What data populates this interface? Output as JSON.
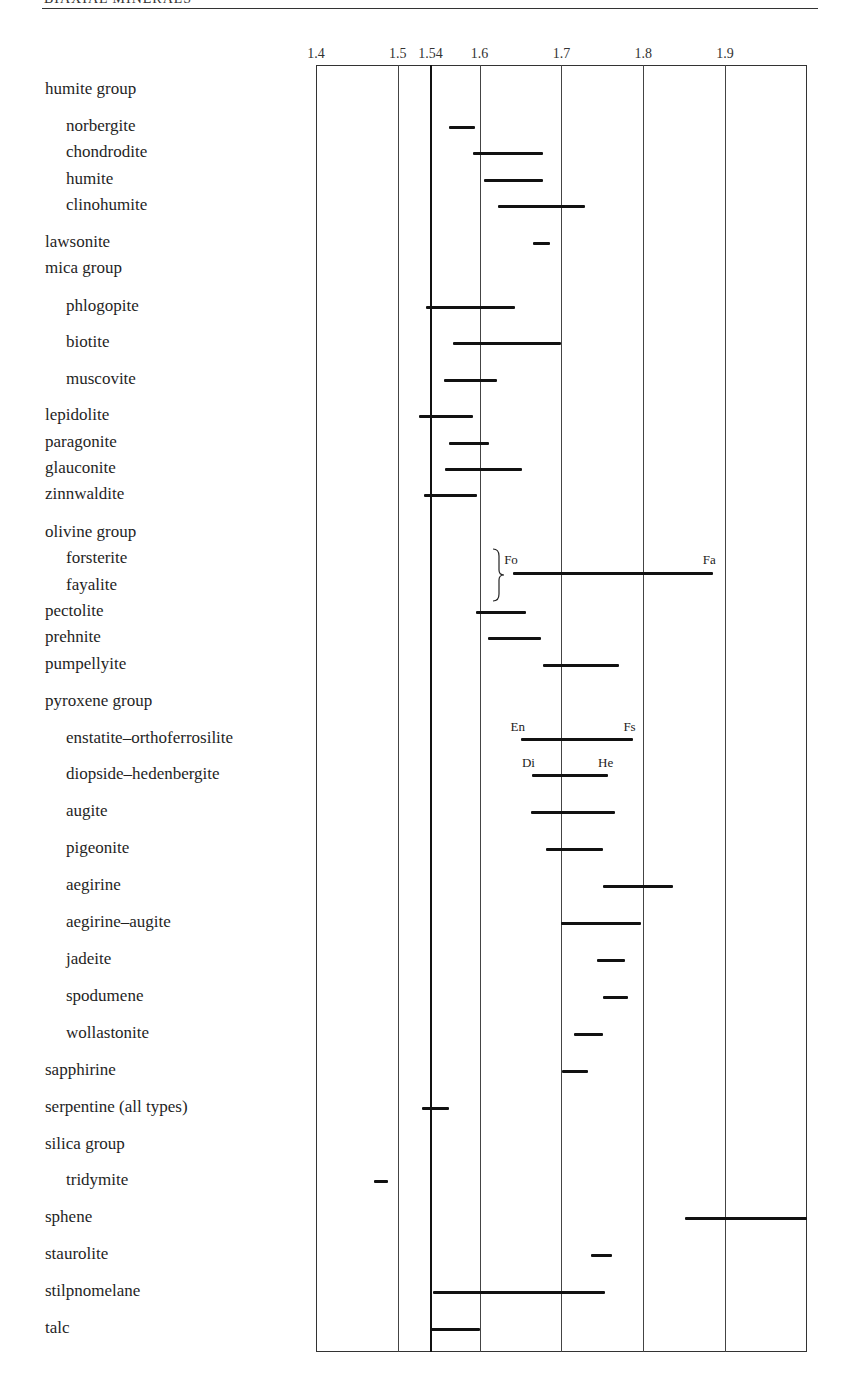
{
  "header": {
    "title": "BIAXIAL MINERALS"
  },
  "chart_data": {
    "type": "range-bar",
    "title": "",
    "xlabel": "",
    "ylabel": "",
    "xlim": [
      1.4,
      2.0
    ],
    "x_ticks": [
      "1.4",
      "1.5",
      "1.54",
      "1.6",
      "1.7",
      "1.8",
      "1.9"
    ],
    "x_tick_values": [
      1.4,
      1.5,
      1.54,
      1.6,
      1.7,
      1.8,
      1.9
    ],
    "reference_line": 1.54,
    "grid": true,
    "legend": null,
    "rows": [
      {
        "label": "humite group",
        "kind": "group",
        "y": 90
      },
      {
        "label": "norbergite",
        "kind": "sub",
        "y": 127,
        "range": [
          1.563,
          1.594
        ]
      },
      {
        "label": "chondrodite",
        "kind": "sub",
        "y": 153,
        "range": [
          1.592,
          1.678
        ]
      },
      {
        "label": "humite",
        "kind": "sub",
        "y": 180,
        "range": [
          1.605,
          1.678
        ]
      },
      {
        "label": "clinohumite",
        "kind": "sub",
        "y": 206,
        "range": [
          1.623,
          1.729
        ]
      },
      {
        "label": "lawsonite",
        "kind": "group",
        "y": 243,
        "range": [
          1.665,
          1.686
        ]
      },
      {
        "label": "mica group",
        "kind": "group",
        "y": 269
      },
      {
        "label": "phlogopite",
        "kind": "sub",
        "y": 307,
        "range": [
          1.534,
          1.643
        ]
      },
      {
        "label": "biotite",
        "kind": "sub",
        "y": 343,
        "range": [
          1.568,
          1.699
        ]
      },
      {
        "label": "muscovite",
        "kind": "sub",
        "y": 380,
        "range": [
          1.556,
          1.621
        ]
      },
      {
        "label": "lepidolite",
        "kind": "group",
        "y": 416,
        "range": [
          1.526,
          1.592
        ]
      },
      {
        "label": "paragonite",
        "kind": "group",
        "y": 443,
        "range": [
          1.562,
          1.612
        ]
      },
      {
        "label": "glauconite",
        "kind": "group",
        "y": 469,
        "range": [
          1.558,
          1.652
        ]
      },
      {
        "label": "zinnwaldite",
        "kind": "group",
        "y": 495,
        "range": [
          1.532,
          1.597
        ]
      },
      {
        "label": "olivine group",
        "kind": "group",
        "y": 533
      },
      {
        "label": "forsterite",
        "kind": "sub",
        "y": 559
      },
      {
        "label": "fayalite",
        "kind": "sub",
        "y": 586
      },
      {
        "label": "pectolite",
        "kind": "group",
        "y": 612,
        "range": [
          1.596,
          1.657
        ]
      },
      {
        "label": "prehnite",
        "kind": "group",
        "y": 638,
        "range": [
          1.61,
          1.675
        ]
      },
      {
        "label": "pumpellyite",
        "kind": "group",
        "y": 665,
        "range": [
          1.678,
          1.771
        ]
      },
      {
        "label": "pyroxene group",
        "kind": "group",
        "y": 702
      },
      {
        "label": "enstatite–orthoferrosilite",
        "kind": "sub",
        "y": 739,
        "range": [
          1.65,
          1.788
        ],
        "end_labels": [
          "En",
          "Fs"
        ]
      },
      {
        "label": "diopside–hedenbergite",
        "kind": "sub",
        "y": 775,
        "range": [
          1.664,
          1.757
        ],
        "end_labels": [
          "Di",
          "He"
        ]
      },
      {
        "label": "augite",
        "kind": "sub",
        "y": 812,
        "range": [
          1.663,
          1.766
        ]
      },
      {
        "label": "pigeonite",
        "kind": "sub",
        "y": 849,
        "range": [
          1.681,
          1.751
        ]
      },
      {
        "label": "aegirine",
        "kind": "sub",
        "y": 886,
        "range": [
          1.751,
          1.836
        ]
      },
      {
        "label": "aegirine–augite",
        "kind": "sub",
        "y": 923,
        "range": [
          1.7,
          1.797
        ]
      },
      {
        "label": "jadeite",
        "kind": "sub",
        "y": 960,
        "range": [
          1.743,
          1.778
        ]
      },
      {
        "label": "spodumene",
        "kind": "sub",
        "y": 997,
        "range": [
          1.751,
          1.781
        ]
      },
      {
        "label": "wollastonite",
        "kind": "sub",
        "y": 1034,
        "range": [
          1.716,
          1.751
        ]
      },
      {
        "label": "sapphirine",
        "kind": "group",
        "y": 1071,
        "range": [
          1.701,
          1.732
        ]
      },
      {
        "label": "serpentine (all types)",
        "kind": "group",
        "y": 1108,
        "range": [
          1.53,
          1.563
        ]
      },
      {
        "label": "silica group",
        "kind": "group",
        "y": 1145
      },
      {
        "label": "tridymite",
        "kind": "sub",
        "y": 1181,
        "range": [
          1.471,
          1.488
        ]
      },
      {
        "label": "sphene",
        "kind": "group",
        "y": 1218,
        "range": [
          1.851,
          2.0
        ]
      },
      {
        "label": "staurolite",
        "kind": "group",
        "y": 1255,
        "range": [
          1.736,
          1.762
        ]
      },
      {
        "label": "stilpnomelane",
        "kind": "group",
        "y": 1292,
        "range": [
          1.543,
          1.753
        ]
      },
      {
        "label": "talc",
        "kind": "group",
        "y": 1329,
        "range": [
          1.54,
          1.6
        ]
      }
    ],
    "olivine_series": {
      "range": [
        1.641,
        1.885
      ],
      "y": 573,
      "end_labels": [
        "Fo",
        "Fa"
      ],
      "brace_rows": [
        "forsterite",
        "fayalite"
      ]
    }
  }
}
